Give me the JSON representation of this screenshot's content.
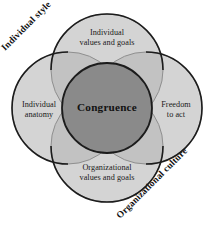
{
  "diagram": {
    "center": {
      "label": "Congruence",
      "fill": "#878787",
      "stroke": "#1c1c1c"
    },
    "circles": [
      {
        "key": "top",
        "label": "Individual values and goals",
        "line1": "Individual",
        "line2": "values and goals",
        "cx": 107,
        "cy": 70,
        "r": 56,
        "fill": "#d2d2d2"
      },
      {
        "key": "left",
        "label": "Individual anatomy",
        "line1": "Individual",
        "line2": "anatomy",
        "cx": 68,
        "cy": 108,
        "r": 56,
        "fill": "#d2d2d2"
      },
      {
        "key": "right",
        "label": "Freedom to act",
        "line1": "Freedom",
        "line2": "to act",
        "cx": 146,
        "cy": 108,
        "r": 56,
        "fill": "#d2d2d2"
      },
      {
        "key": "bottom",
        "label": "Organizational values and goals",
        "line1": "Organizational",
        "line2": "values and goals",
        "cx": 107,
        "cy": 146,
        "r": 56,
        "fill": "#d2d2d2"
      }
    ],
    "axis_labels": [
      {
        "key": "individual-style",
        "text": "Individual style"
      },
      {
        "key": "organizational-culture",
        "text": "Organizational culture"
      }
    ],
    "colors": {
      "background": "#ffffff",
      "circle_fill": "#d2d2d2",
      "overlap_two": "#c0c0c0",
      "center_fill": "#878787",
      "stroke": "#1c1c1c",
      "inner_stroke": "#8d8d8d",
      "text": "#141414"
    }
  }
}
